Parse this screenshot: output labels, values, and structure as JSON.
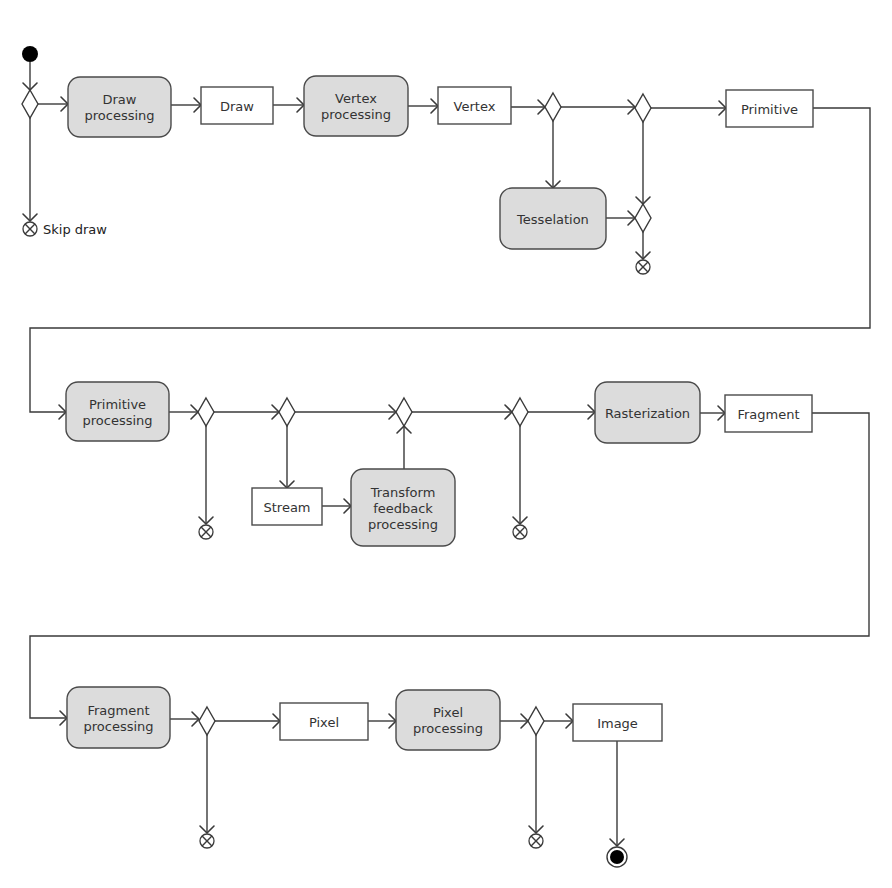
{
  "diagram": {
    "colors": {
      "activity_fill": "#dcdcdc",
      "object_fill": "#ffffff",
      "stroke": "#3a3a3a",
      "text": "#333333"
    },
    "initial_node": {
      "cx": 30,
      "cy": 54,
      "r": 8
    },
    "final_node": {
      "cx": 617,
      "cy": 857,
      "r": 10,
      "inner_r": 7
    },
    "activities": [
      {
        "id": "draw-processing",
        "lines": [
          "Draw",
          "processing"
        ],
        "x": 68,
        "y": 77,
        "w": 103,
        "h": 60
      },
      {
        "id": "vertex-processing",
        "lines": [
          "Vertex",
          "processing"
        ],
        "x": 304,
        "y": 76,
        "w": 104,
        "h": 60
      },
      {
        "id": "tesselation",
        "lines": [
          "Tesselation"
        ],
        "x": 500,
        "y": 188,
        "w": 106,
        "h": 61
      },
      {
        "id": "primitive-processing",
        "lines": [
          "Primitive",
          "processing"
        ],
        "x": 66,
        "y": 382,
        "w": 103,
        "h": 59
      },
      {
        "id": "transform-feedback-processing",
        "lines": [
          "Transform",
          "feedback",
          "processing"
        ],
        "x": 351,
        "y": 469,
        "w": 104,
        "h": 77
      },
      {
        "id": "rasterization",
        "lines": [
          "Rasterization"
        ],
        "x": 595,
        "y": 382,
        "w": 105,
        "h": 61
      },
      {
        "id": "fragment-processing",
        "lines": [
          "Fragment",
          "processing"
        ],
        "x": 67,
        "y": 687,
        "w": 103,
        "h": 61
      },
      {
        "id": "pixel-processing",
        "lines": [
          "Pixel",
          "processing"
        ],
        "x": 396,
        "y": 690,
        "w": 104,
        "h": 60
      }
    ],
    "objects": [
      {
        "id": "draw",
        "label": "Draw",
        "x": 201,
        "y": 87,
        "w": 72,
        "h": 37
      },
      {
        "id": "vertex",
        "label": "Vertex",
        "x": 438,
        "y": 87,
        "w": 73,
        "h": 37
      },
      {
        "id": "primitive",
        "label": "Primitive",
        "x": 726,
        "y": 90,
        "w": 87,
        "h": 37
      },
      {
        "id": "stream",
        "label": "Stream",
        "x": 252,
        "y": 488,
        "w": 70,
        "h": 37
      },
      {
        "id": "fragment",
        "label": "Fragment",
        "x": 725,
        "y": 395,
        "w": 87,
        "h": 37
      },
      {
        "id": "pixel",
        "label": "Pixel",
        "x": 280,
        "y": 703,
        "w": 88,
        "h": 37
      },
      {
        "id": "image",
        "label": "Image",
        "x": 573,
        "y": 704,
        "w": 89,
        "h": 37
      }
    ],
    "decisions": [
      {
        "id": "d-draw",
        "cx": 30,
        "cy": 104
      },
      {
        "id": "d-tess",
        "cx": 553,
        "cy": 107
      },
      {
        "id": "d-geom",
        "cx": 643,
        "cy": 108
      },
      {
        "id": "d-tess-merge",
        "cx": 643,
        "cy": 218
      },
      {
        "id": "d-prim-discard",
        "cx": 206,
        "cy": 412
      },
      {
        "id": "d-stream",
        "cx": 287,
        "cy": 412
      },
      {
        "id": "d-tf-merge",
        "cx": 404,
        "cy": 412
      },
      {
        "id": "d-raster-discard",
        "cx": 520,
        "cy": 412
      },
      {
        "id": "d-frag-discard",
        "cx": 207,
        "cy": 721
      },
      {
        "id": "d-pixel-discard",
        "cx": 536,
        "cy": 721
      }
    ],
    "flow_finals": [
      {
        "id": "ff-skip-draw",
        "cx": 30,
        "cy": 229,
        "label": "Skip draw"
      },
      {
        "id": "ff-after-tess",
        "cx": 643,
        "cy": 267,
        "label": ""
      },
      {
        "id": "ff-prim",
        "cx": 206,
        "cy": 532,
        "label": ""
      },
      {
        "id": "ff-raster",
        "cx": 520,
        "cy": 532,
        "label": ""
      },
      {
        "id": "ff-frag",
        "cx": 207,
        "cy": 841,
        "label": ""
      },
      {
        "id": "ff-pixel",
        "cx": 536,
        "cy": 841,
        "label": ""
      }
    ],
    "edges": [
      {
        "points": [
          [
            30,
            62
          ],
          [
            30,
            90
          ]
        ],
        "arrow": "down"
      },
      {
        "points": [
          [
            38,
            104
          ],
          [
            68,
            104
          ]
        ],
        "arrow": "right"
      },
      {
        "points": [
          [
            30,
            118
          ],
          [
            30,
            221
          ]
        ],
        "arrow": "down"
      },
      {
        "points": [
          [
            171,
            105
          ],
          [
            201,
            105
          ]
        ],
        "arrow": "right"
      },
      {
        "points": [
          [
            273,
            105
          ],
          [
            304,
            105
          ]
        ],
        "arrow": "right"
      },
      {
        "points": [
          [
            408,
            106
          ],
          [
            438,
            106
          ]
        ],
        "arrow": "right"
      },
      {
        "points": [
          [
            511,
            107
          ],
          [
            545,
            107
          ]
        ],
        "arrow": "right"
      },
      {
        "points": [
          [
            561,
            107
          ],
          [
            635,
            107
          ]
        ],
        "arrow": "right"
      },
      {
        "points": [
          [
            553,
            121
          ],
          [
            553,
            188
          ]
        ],
        "arrow": "down"
      },
      {
        "points": [
          [
            651,
            108
          ],
          [
            726,
            108
          ]
        ],
        "arrow": "right"
      },
      {
        "points": [
          [
            643,
            122
          ],
          [
            643,
            204
          ]
        ],
        "arrow": "down"
      },
      {
        "points": [
          [
            606,
            218
          ],
          [
            635,
            218
          ]
        ],
        "arrow": "right"
      },
      {
        "points": [
          [
            643,
            232
          ],
          [
            643,
            259
          ]
        ],
        "arrow": "down"
      },
      {
        "points": [
          [
            813,
            108
          ],
          [
            870,
            108
          ],
          [
            870,
            328
          ],
          [
            30,
            328
          ],
          [
            30,
            412
          ],
          [
            66,
            412
          ]
        ],
        "arrow": "right"
      },
      {
        "points": [
          [
            169,
            412
          ],
          [
            198,
            412
          ]
        ],
        "arrow": "right"
      },
      {
        "points": [
          [
            214,
            412
          ],
          [
            279,
            412
          ]
        ],
        "arrow": "right"
      },
      {
        "points": [
          [
            206,
            426
          ],
          [
            206,
            524
          ]
        ],
        "arrow": "down"
      },
      {
        "points": [
          [
            295,
            412
          ],
          [
            396,
            412
          ]
        ],
        "arrow": "right"
      },
      {
        "points": [
          [
            287,
            426
          ],
          [
            287,
            488
          ]
        ],
        "arrow": "down"
      },
      {
        "points": [
          [
            322,
            506
          ],
          [
            351,
            506
          ]
        ],
        "arrow": "right"
      },
      {
        "points": [
          [
            404,
            469
          ],
          [
            404,
            426
          ]
        ],
        "arrow": "up"
      },
      {
        "points": [
          [
            412,
            412
          ],
          [
            512,
            412
          ]
        ],
        "arrow": "right"
      },
      {
        "points": [
          [
            520,
            426
          ],
          [
            520,
            524
          ]
        ],
        "arrow": "down"
      },
      {
        "points": [
          [
            528,
            412
          ],
          [
            595,
            412
          ]
        ],
        "arrow": "right"
      },
      {
        "points": [
          [
            700,
            413
          ],
          [
            725,
            413
          ]
        ],
        "arrow": "right"
      },
      {
        "points": [
          [
            812,
            413
          ],
          [
            869,
            413
          ],
          [
            869,
            636
          ],
          [
            30,
            636
          ],
          [
            30,
            718
          ],
          [
            67,
            718
          ]
        ],
        "arrow": "right"
      },
      {
        "points": [
          [
            170,
            719
          ],
          [
            199,
            719
          ]
        ],
        "arrow": "right"
      },
      {
        "points": [
          [
            215,
            721
          ],
          [
            280,
            721
          ]
        ],
        "arrow": "right"
      },
      {
        "points": [
          [
            207,
            735
          ],
          [
            207,
            833
          ]
        ],
        "arrow": "down"
      },
      {
        "points": [
          [
            368,
            721
          ],
          [
            396,
            721
          ]
        ],
        "arrow": "right"
      },
      {
        "points": [
          [
            500,
            721
          ],
          [
            528,
            721
          ]
        ],
        "arrow": "right"
      },
      {
        "points": [
          [
            544,
            721
          ],
          [
            573,
            721
          ]
        ],
        "arrow": "right"
      },
      {
        "points": [
          [
            536,
            735
          ],
          [
            536,
            833
          ]
        ],
        "arrow": "down"
      },
      {
        "points": [
          [
            617,
            741
          ],
          [
            617,
            846
          ]
        ],
        "arrow": "down"
      }
    ]
  }
}
